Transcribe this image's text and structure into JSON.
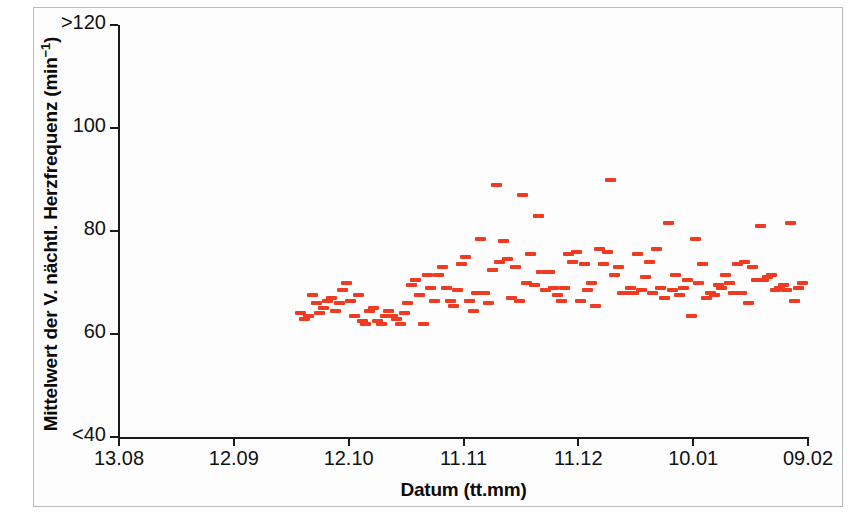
{
  "figure": {
    "background_color": "#ffffff",
    "frame_color": "#b9bcbe",
    "marker_color": "#ee3b22",
    "axis_color": "#1a1a1a"
  },
  "axes": {
    "y_title_main": "Mittelwert der V. nächtl. Herzfrequenz (min",
    "y_title_sup": "−1",
    "y_title_close": ")",
    "y_title_full": "Mittelwert der V. nächtl. Herzfrequenz (min⁻¹)",
    "x_title": "Datum (tt.mm)",
    "y_ticks": [
      {
        "label": ">120",
        "value": 120
      },
      {
        "label": "100",
        "value": 100
      },
      {
        "label": "80",
        "value": 80
      },
      {
        "label": "60",
        "value": 60
      },
      {
        "label": "<40",
        "value": 40
      }
    ],
    "x_ticks": [
      {
        "label": "13.08",
        "value": 0
      },
      {
        "label": "12.09",
        "value": 30
      },
      {
        "label": "12.10",
        "value": 60
      },
      {
        "label": "11.11",
        "value": 90
      },
      {
        "label": "11.12",
        "value": 120
      },
      {
        "label": "10.01",
        "value": 150
      },
      {
        "label": "09.02",
        "value": 180
      }
    ]
  },
  "chart_data": {
    "type": "scatter",
    "title": "",
    "xlabel": "Datum (tt.mm)",
    "ylabel": "Mittelwert der V. nächtl. Herzfrequenz (min⁻¹)",
    "xlim": [
      0,
      180
    ],
    "ylim": [
      40,
      120
    ],
    "xtick_labels": [
      "13.08",
      "12.09",
      "12.10",
      "11.11",
      "11.12",
      "10.01",
      "09.02"
    ],
    "xtick_values": [
      0,
      30,
      60,
      90,
      120,
      150,
      180
    ],
    "ytick_labels": [
      ">120",
      "100",
      "80",
      "60",
      "<40"
    ],
    "ytick_values": [
      120,
      100,
      80,
      60,
      40
    ],
    "grid": false,
    "legend": "none",
    "marker": "horizontal-dash",
    "marker_color": "#ee3b22",
    "series": [
      {
        "name": "Mittlere nächtliche Herzfrequenz",
        "x": [
          47.5,
          48.5,
          49.5,
          50.5,
          51.5,
          52.5,
          53.5,
          54.5,
          55.5,
          56.5,
          57.5,
          58.5,
          59.5,
          60.5,
          61.5,
          62.5,
          63.5,
          64.5,
          65.5,
          66.5,
          67.5,
          68.5,
          69.5,
          70.5,
          71.5,
          72.5,
          73.5,
          74.5,
          75.5,
          76.5,
          77.5,
          78.5,
          79.5,
          80.5,
          81.5,
          82.5,
          83.5,
          84.5,
          85.5,
          86.5,
          87.5,
          88.5,
          89.5,
          90.5,
          91.5,
          92.5,
          93.5,
          94.5,
          95.5,
          96.5,
          97.5,
          98.5,
          99.5,
          100.5,
          101.5,
          102.5,
          103.5,
          104.5,
          105.5,
          106.5,
          107.5,
          108.5,
          109.5,
          110.5,
          111.5,
          112.5,
          113.5,
          114.5,
          115.5,
          116.5,
          117.5,
          118.5,
          119.5,
          120.5,
          121.5,
          122.5,
          123.5,
          124.5,
          125.5,
          126.5,
          127.5,
          128.5,
          129.5,
          130.5,
          131.5,
          132.5,
          133.5,
          134.5,
          135.5,
          136.5,
          137.5,
          138.5,
          139.5,
          140.5,
          141.5,
          142.5,
          143.5,
          144.5,
          145.5,
          146.5,
          147.5,
          148.5,
          149.5,
          150.5,
          151.5,
          152.5,
          153.5,
          154.5,
          155.5,
          156.5,
          157.5,
          158.5,
          159.5,
          160.5,
          161.5,
          162.5,
          163.5,
          164.5,
          165.5,
          166.5,
          167.5,
          168.5,
          169.5,
          170.5,
          171.5,
          172.5,
          173.5,
          174.5,
          175.5,
          176.5,
          177.5,
          178.5
        ],
        "y": [
          64.0,
          63.0,
          63.5,
          67.5,
          66.0,
          64.0,
          65.0,
          66.5,
          67.0,
          64.5,
          66.0,
          68.5,
          70.0,
          66.5,
          63.5,
          67.5,
          62.5,
          62.0,
          64.5,
          65.0,
          62.5,
          62.0,
          63.5,
          64.5,
          63.5,
          63.0,
          62.0,
          64.0,
          66.0,
          69.5,
          70.5,
          67.5,
          62.0,
          71.5,
          69.0,
          66.5,
          71.5,
          73.0,
          69.0,
          66.5,
          65.5,
          68.5,
          73.5,
          75.0,
          66.5,
          64.5,
          68.0,
          78.5,
          68.0,
          66.0,
          72.5,
          89.0,
          74.0,
          78.0,
          74.5,
          67.0,
          73.0,
          66.5,
          87.0,
          70.0,
          75.5,
          69.5,
          83.0,
          72.0,
          68.5,
          72.0,
          69.0,
          67.5,
          66.5,
          69.0,
          75.5,
          74.0,
          76.0,
          66.5,
          73.5,
          68.5,
          70.0,
          65.5,
          76.5,
          73.5,
          76.0,
          90.0,
          71.5,
          73.0,
          68.0,
          68.0,
          69.0,
          68.0,
          75.5,
          68.5,
          71.0,
          74.0,
          68.0,
          76.5,
          69.0,
          67.0,
          81.5,
          68.5,
          71.5,
          67.5,
          69.0,
          70.5,
          63.5,
          78.5,
          70.0,
          73.5,
          67.0,
          68.0,
          67.5,
          69.5,
          69.0,
          71.5,
          70.0,
          68.0,
          73.5,
          68.0,
          74.0,
          66.0,
          73.0,
          70.5,
          81.0,
          70.5,
          71.0,
          71.5,
          68.5,
          69.0,
          69.5,
          68.5,
          81.5,
          66.5,
          69.0,
          70.0
        ]
      }
    ]
  }
}
